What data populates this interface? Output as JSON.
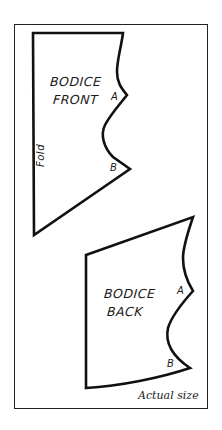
{
  "diagram": {
    "type": "sewing-pattern",
    "frame_color": "#222222",
    "line_color": "#111111",
    "background": "#ffffff",
    "scale_note": "Actual size",
    "pieces": [
      {
        "id": "bodice-front",
        "title_line1": "BODICE",
        "title_line2": "FRONT",
        "fold_label": "Fold",
        "notches": [
          {
            "label": "A"
          },
          {
            "label": "B"
          }
        ]
      },
      {
        "id": "bodice-back",
        "title_line1": "BODICE",
        "title_line2": "BACK",
        "notches": [
          {
            "label": "A"
          },
          {
            "label": "B"
          }
        ]
      }
    ]
  }
}
